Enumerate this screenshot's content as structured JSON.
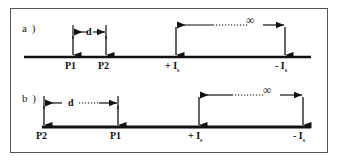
{
  "figure": {
    "panels": [
      {
        "id": "a",
        "label": "a )",
        "axis": {
          "x1": 24,
          "x2": 311,
          "y": 57
        },
        "markers": [
          {
            "name": "p1",
            "label": "P1",
            "subscript": "",
            "x": 73
          },
          {
            "name": "p2",
            "label": "P2",
            "subscript": "",
            "x": 106
          },
          {
            "name": "plus-is",
            "label": "+ I",
            "subscript": "s",
            "x": 176
          },
          {
            "name": "minus-is",
            "label": "- I",
            "subscript": "s",
            "x": 285
          }
        ],
        "dimension": {
          "name": "d",
          "label": "d",
          "x1": 73,
          "x2": 106,
          "y": 32,
          "style": "solid"
        },
        "infinity": {
          "label": "∞",
          "x1": 176,
          "x2": 285,
          "y": 25,
          "style": "dotted"
        }
      },
      {
        "id": "b",
        "label": "b )",
        "axis": {
          "x1": 42,
          "x2": 311,
          "y": 127
        },
        "markers": [
          {
            "name": "p2",
            "label": "P2",
            "subscript": "",
            "x": 44
          },
          {
            "name": "p1",
            "label": "P1",
            "subscript": "",
            "x": 118
          },
          {
            "name": "plus-is",
            "label": "+ I",
            "subscript": "s",
            "x": 199
          },
          {
            "name": "minus-is",
            "label": "- I",
            "subscript": "s",
            "x": 303
          }
        ],
        "dimension": {
          "name": "d",
          "label": "d",
          "x1": 44,
          "x2": 118,
          "y": 103,
          "style": "dotted"
        },
        "infinity": {
          "label": "∞",
          "x1": 199,
          "x2": 303,
          "y": 95,
          "style": "dotted"
        }
      }
    ],
    "colors": {
      "line": "#111111",
      "frame": "#555555",
      "background": "#ffffff"
    }
  }
}
